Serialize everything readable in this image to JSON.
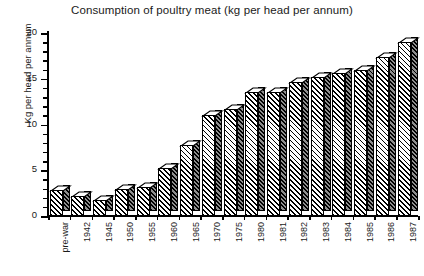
{
  "chart_data": {
    "type": "bar",
    "title": "Consumption of poultry meat (kg per head per annum)",
    "xlabel": "",
    "ylabel": "Kg per head per annum",
    "categories": [
      "pre-war",
      "1942",
      "1945",
      "1950",
      "1955",
      "1960",
      "1965",
      "1970",
      "1975",
      "1980",
      "1981",
      "1982",
      "1983",
      "1984",
      "1985",
      "1986",
      "1987"
    ],
    "values": [
      2.8,
      2.2,
      1.7,
      3.0,
      3.2,
      5.3,
      7.8,
      11.0,
      11.7,
      13.6,
      13.6,
      14.6,
      15.2,
      15.6,
      16.0,
      17.4,
      19.0
    ],
    "ylim": [
      0,
      20
    ],
    "yticks": [
      0,
      5,
      10,
      15,
      20
    ],
    "ytick_labels": [
      "0",
      "5",
      "10",
      "15",
      "20"
    ],
    "yminor_step": 1,
    "grid": false,
    "legend": null,
    "style": "3d-hatched-monochrome",
    "units": "kg per head per annum"
  },
  "colors": {
    "axis": "#000000",
    "text": "#1a1a1a",
    "bar_front": "#ffffff",
    "bar_front_hatch": "#000000",
    "bar_side": "#555555",
    "background": "#ffffff"
  }
}
